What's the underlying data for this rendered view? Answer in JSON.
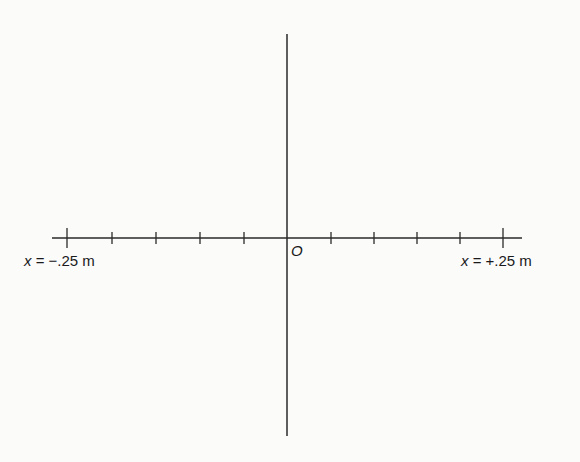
{
  "diagram": {
    "type": "number-line-axes",
    "origin_label": "O",
    "left_end_label": {
      "var": "x",
      "text": " = −.25 m"
    },
    "right_end_label": {
      "var": "x",
      "text": " = +.25 m"
    },
    "tick_count": 11,
    "tick_positions_m": [
      -0.25,
      -0.2,
      -0.15,
      -0.1,
      -0.05,
      0,
      0.05,
      0.1,
      0.15,
      0.2,
      0.25
    ],
    "line_color": "#2a2a2a",
    "background": "#fbfbfa"
  }
}
